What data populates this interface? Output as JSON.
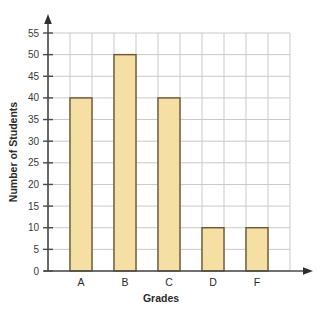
{
  "chart_data": {
    "type": "bar",
    "title": "",
    "categories": [
      "A",
      "B",
      "C",
      "D",
      "F"
    ],
    "values": [
      40,
      50,
      40,
      10,
      10
    ],
    "series": [
      {
        "name": "Number of Students",
        "values": [
          40,
          50,
          40,
          10,
          10
        ]
      }
    ],
    "xlabel": "Grades",
    "ylabel": "Number of Students",
    "ylim": [
      0,
      55
    ],
    "ytick_step": 5,
    "yticks": [
      0,
      5,
      10,
      15,
      20,
      25,
      30,
      35,
      40,
      45,
      50,
      55
    ],
    "ytick_labels": [
      "0",
      "5",
      "10",
      "15",
      "20",
      "25",
      "30",
      "35",
      "40",
      "45",
      "50",
      "55"
    ],
    "grid": true,
    "legend": "none",
    "axis_arrows": true,
    "colors": {
      "bar_fill": "#f5dfa3",
      "bar_stroke": "#6b5633",
      "grid_line": "#c9c9c9",
      "axis_line": "#4a4a4a",
      "text": "#2b2b2b",
      "background": "#ffffff"
    }
  },
  "axes": {
    "y_title": "Number of Students",
    "x_title": "Grades"
  }
}
